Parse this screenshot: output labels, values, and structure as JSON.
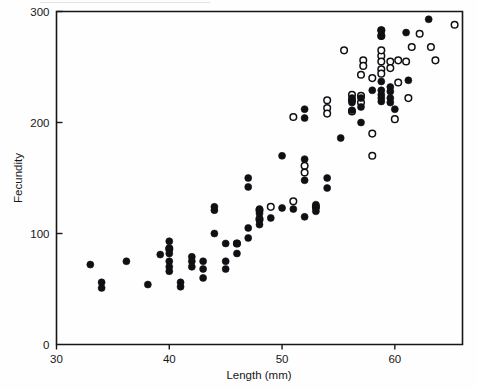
{
  "figure": {
    "background_color": "#fefefe",
    "marker_color": "#101014"
  },
  "chart_data": {
    "type": "scatter",
    "title": "",
    "subtitle": "",
    "xlabel": "Length (mm)",
    "ylabel": "Fecundity",
    "xlim": [
      30,
      66
    ],
    "ylim": [
      0,
      300
    ],
    "xticks": [
      30,
      40,
      50,
      60
    ],
    "yticks": [
      0,
      100,
      200,
      300
    ],
    "xtick_labels": [
      "30",
      "40",
      "50",
      "60"
    ],
    "ytick_labels": [
      "0",
      "100",
      "200",
      "300"
    ],
    "grid": false,
    "legend": null,
    "legend_position": "none",
    "annotations": [],
    "series": [
      {
        "name": "filled-circles",
        "marker": "filled-circle",
        "color": "#101014",
        "points": [
          [
            33.0,
            72
          ],
          [
            34.0,
            56
          ],
          [
            34.0,
            51
          ],
          [
            36.2,
            75
          ],
          [
            38.1,
            54
          ],
          [
            39.2,
            81
          ],
          [
            40.0,
            93
          ],
          [
            40.0,
            87
          ],
          [
            40.0,
            82
          ],
          [
            40.0,
            75
          ],
          [
            40.0,
            70
          ],
          [
            40.0,
            66
          ],
          [
            41.0,
            56
          ],
          [
            41.0,
            52
          ],
          [
            42.0,
            79
          ],
          [
            42.0,
            75
          ],
          [
            42.0,
            70
          ],
          [
            43.0,
            75
          ],
          [
            43.0,
            68
          ],
          [
            43.0,
            60
          ],
          [
            44.0,
            124
          ],
          [
            44.0,
            121
          ],
          [
            44.0,
            100
          ],
          [
            45.0,
            91
          ],
          [
            45.0,
            75
          ],
          [
            45.0,
            68
          ],
          [
            46.0,
            91
          ],
          [
            46.0,
            82
          ],
          [
            47.0,
            150
          ],
          [
            47.0,
            142
          ],
          [
            47.0,
            105
          ],
          [
            47.0,
            96
          ],
          [
            48.0,
            122
          ],
          [
            48.0,
            118
          ],
          [
            48.0,
            112
          ],
          [
            48.0,
            108
          ],
          [
            49.0,
            114
          ],
          [
            50.0,
            170
          ],
          [
            50.0,
            123
          ],
          [
            51.0,
            122
          ],
          [
            52.0,
            167
          ],
          [
            52.0,
            148
          ],
          [
            52.0,
            115
          ],
          [
            52.0,
            212
          ],
          [
            52.0,
            204
          ],
          [
            53.0,
            126
          ],
          [
            53.0,
            123
          ],
          [
            53.0,
            120
          ],
          [
            54.0,
            150
          ],
          [
            54.0,
            141
          ],
          [
            55.2,
            186
          ],
          [
            56.2,
            222
          ],
          [
            56.2,
            218
          ],
          [
            56.2,
            211
          ],
          [
            57.0,
            222
          ],
          [
            57.0,
            214
          ],
          [
            57.0,
            200
          ],
          [
            58.0,
            229
          ],
          [
            58.8,
            283
          ],
          [
            58.8,
            278
          ],
          [
            58.8,
            237
          ],
          [
            58.8,
            229
          ],
          [
            58.8,
            225
          ],
          [
            58.8,
            222
          ],
          [
            58.8,
            219
          ],
          [
            59.6,
            232
          ],
          [
            59.6,
            228
          ],
          [
            59.6,
            222
          ],
          [
            59.6,
            218
          ],
          [
            60.0,
            212
          ],
          [
            61.0,
            281
          ],
          [
            61.2,
            238
          ],
          [
            63.0,
            293
          ]
        ]
      },
      {
        "name": "open-circles",
        "marker": "open-circle",
        "color": "#101014",
        "points": [
          [
            40.0,
            86
          ],
          [
            46.0,
            91
          ],
          [
            48.0,
            121
          ],
          [
            48.0,
            113
          ],
          [
            49.0,
            124
          ],
          [
            51.0,
            129
          ],
          [
            51.0,
            205
          ],
          [
            52.0,
            161
          ],
          [
            52.0,
            155
          ],
          [
            53.0,
            124
          ],
          [
            54.0,
            220
          ],
          [
            54.0,
            213
          ],
          [
            54.0,
            208
          ],
          [
            55.5,
            265
          ],
          [
            56.2,
            225
          ],
          [
            56.2,
            220
          ],
          [
            56.2,
            210
          ],
          [
            57.0,
            243
          ],
          [
            57.0,
            224
          ],
          [
            57.0,
            218
          ],
          [
            57.2,
            256
          ],
          [
            57.2,
            251
          ],
          [
            58.0,
            190
          ],
          [
            58.0,
            170
          ],
          [
            58.0,
            240
          ],
          [
            58.8,
            283
          ],
          [
            58.8,
            278
          ],
          [
            58.8,
            260
          ],
          [
            58.8,
            255
          ],
          [
            58.8,
            248
          ],
          [
            58.8,
            244
          ],
          [
            58.8,
            265
          ],
          [
            59.6,
            255
          ],
          [
            59.6,
            249
          ],
          [
            60.0,
            203
          ],
          [
            60.3,
            256
          ],
          [
            60.3,
            236
          ],
          [
            61.0,
            255
          ],
          [
            61.2,
            222
          ],
          [
            61.5,
            268
          ],
          [
            62.2,
            280
          ],
          [
            63.2,
            268
          ],
          [
            63.6,
            256
          ],
          [
            65.3,
            288
          ]
        ]
      }
    ]
  }
}
